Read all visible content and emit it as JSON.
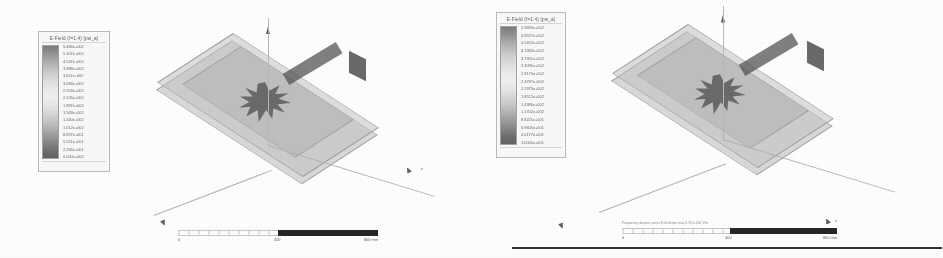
{
  "figure": {
    "background_color": "#ffffff"
  },
  "views": [
    {
      "id": "view-left",
      "legend": {
        "title": "E-Field (f=1.4) [pw_a]",
        "colorbar_colors": [
          "#6f6f6f",
          "#c6c6c6",
          "#f4f4f4",
          "#bdbdbd",
          "#525252"
        ],
        "ticks": [
          "5.466e+002",
          "5.107e+002",
          "4.547e+002",
          "3.988e+002",
          "3.611e+002",
          "3.083e+002",
          "2.554e+002",
          "2.226e+002",
          "1.897e+002",
          "1.569e+002",
          "1.340e+002",
          "1.012e+002",
          "8.837e+001",
          "5.551e+001",
          "2.266e+001",
          "0.000e+000"
        ]
      },
      "scene": {
        "probe_label": "z",
        "axis_label_x": "x",
        "axis_label_y": "y"
      },
      "ruler": {
        "note": "",
        "start": "0",
        "mid": "400",
        "end": "800 mm"
      }
    },
    {
      "id": "view-right",
      "legend": {
        "title": "E-Field (f=1.4) [pw_a]",
        "colorbar_colors": [
          "#6f6f6f",
          "#c6c6c6",
          "#f4f4f4",
          "#bdbdbd",
          "#525252"
        ],
        "ticks": [
          "5.3695e+002",
          "4.9527e+002",
          "4.5452e+002",
          "4.1382e+002",
          "3.7351e+002",
          "3.3091e+002",
          "2.9175e+002",
          "2.4797e+002",
          "2.1973e+002",
          "1.8512e+002",
          "1.4386e+002",
          "1.1702e+002",
          "9.8221e+001",
          "6.9605e+001",
          "4.0177e+001",
          "1.0005e+001"
        ]
      },
      "scene": {
        "probe_label": "z",
        "axis_label_x": "x",
        "axis_label_y": "y"
      },
      "ruler": {
        "note": "Frequency domain solver  E-field  abs  max 5.37e+002 V/m",
        "start": "0",
        "mid": "400",
        "end": "800 mm"
      }
    }
  ]
}
